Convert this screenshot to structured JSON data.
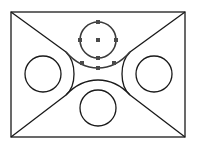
{
  "diagram": {
    "type": "cad-sketch",
    "colors": {
      "line": "#1a1a1a",
      "selected": "#3a3a3a",
      "grip": "#4a4a4a",
      "background": "#ffffff"
    },
    "rectangle": {
      "x1": 11,
      "y1": 12,
      "x2": 185,
      "y2": 137
    },
    "circles": [
      {
        "name": "top",
        "cx": 98,
        "cy": 40,
        "r": 18,
        "selected": true
      },
      {
        "name": "left",
        "cx": 43,
        "cy": 74,
        "r": 18,
        "selected": false
      },
      {
        "name": "right",
        "cx": 154,
        "cy": 74,
        "r": 18,
        "selected": false
      },
      {
        "name": "bottom",
        "cx": 98,
        "cy": 108,
        "r": 18,
        "selected": false
      }
    ],
    "selected_arc": {
      "name": "top-fillet-arc",
      "selected": true
    }
  }
}
